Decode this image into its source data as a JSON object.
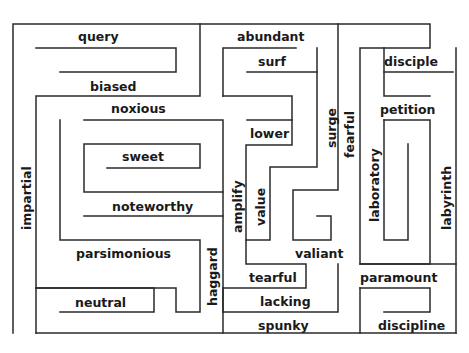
{
  "maze": {
    "line_color": "#2a2a2a",
    "words": [
      {
        "id": "query",
        "text": "query",
        "x": 78,
        "y": 31,
        "vertical": false
      },
      {
        "id": "biased",
        "text": "biased",
        "x": 90,
        "y": 81,
        "vertical": false
      },
      {
        "id": "noxious",
        "text": "noxious",
        "x": 111,
        "y": 103,
        "vertical": false
      },
      {
        "id": "sweet",
        "text": "sweet",
        "x": 122,
        "y": 151,
        "vertical": false
      },
      {
        "id": "noteworthy",
        "text": "noteworthy",
        "x": 112,
        "y": 201,
        "vertical": false
      },
      {
        "id": "parsimonious",
        "text": "parsimonious",
        "x": 76,
        "y": 248,
        "vertical": false
      },
      {
        "id": "neutral",
        "text": "neutral",
        "x": 75,
        "y": 297,
        "vertical": false
      },
      {
        "id": "impartial",
        "text": "impartial",
        "x": 21,
        "y": 230,
        "vertical": true
      },
      {
        "id": "abundant",
        "text": "abundant",
        "x": 237,
        "y": 31,
        "vertical": false
      },
      {
        "id": "surf",
        "text": "surf",
        "x": 258,
        "y": 56,
        "vertical": false
      },
      {
        "id": "lower",
        "text": "lower",
        "x": 250,
        "y": 128,
        "vertical": false
      },
      {
        "id": "surge",
        "text": "surge",
        "x": 326,
        "y": 148,
        "vertical": true
      },
      {
        "id": "fearful",
        "text": "fearful",
        "x": 344,
        "y": 158,
        "vertical": true
      },
      {
        "id": "amplify",
        "text": "amplify",
        "x": 232,
        "y": 233,
        "vertical": true
      },
      {
        "id": "value",
        "text": "value",
        "x": 255,
        "y": 226,
        "vertical": true
      },
      {
        "id": "haggard",
        "text": "haggard",
        "x": 207,
        "y": 306,
        "vertical": true
      },
      {
        "id": "valiant",
        "text": "valiant",
        "x": 295,
        "y": 248,
        "vertical": false
      },
      {
        "id": "tearful",
        "text": "tearful",
        "x": 249,
        "y": 272,
        "vertical": false
      },
      {
        "id": "lacking",
        "text": "lacking",
        "x": 260,
        "y": 296,
        "vertical": false
      },
      {
        "id": "spunky",
        "text": "spunky",
        "x": 258,
        "y": 320,
        "vertical": false
      },
      {
        "id": "disciple",
        "text": "disciple",
        "x": 384,
        "y": 56,
        "vertical": false
      },
      {
        "id": "petition",
        "text": "petition",
        "x": 380,
        "y": 104,
        "vertical": false
      },
      {
        "id": "laboratory",
        "text": "laboratory",
        "x": 369,
        "y": 222,
        "vertical": true
      },
      {
        "id": "labyrinth",
        "text": "labyrinth",
        "x": 441,
        "y": 230,
        "vertical": true
      },
      {
        "id": "paramount",
        "text": "paramount",
        "x": 360,
        "y": 272,
        "vertical": false
      },
      {
        "id": "discipline",
        "text": "discipline",
        "x": 378,
        "y": 320,
        "vertical": false
      }
    ]
  }
}
